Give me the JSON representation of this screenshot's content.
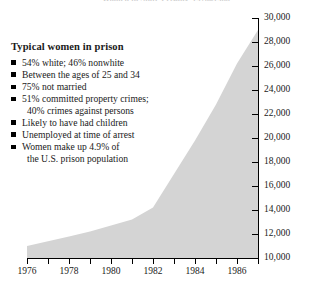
{
  "figure": {
    "title": "Women in State Prisons, 1976–1986",
    "fill_color": "#d4d4d4",
    "axis_color": "#000000"
  },
  "legend": {
    "heading": "Typical women in prison",
    "bullet_glyph": "square-bullet",
    "items": [
      {
        "line1": "54% white; 46% nonwhite",
        "line2": ""
      },
      {
        "line1": "Between the ages of 25 and 34",
        "line2": ""
      },
      {
        "line1": "75% not married",
        "line2": ""
      },
      {
        "line1": "51% committed property crimes;",
        "line2": "40% crimes against persons"
      },
      {
        "line1": "Likely to have had children",
        "line2": ""
      },
      {
        "line1": "Unemployed at time of arrest",
        "line2": ""
      },
      {
        "line1": "Women make up 4.9% of",
        "line2": "the U.S. prison population"
      }
    ]
  },
  "chart_data": {
    "type": "area",
    "title": "Women in State Prisons, 1976–1986",
    "xlabel": "",
    "ylabel": "",
    "xlim": [
      1976,
      1987
    ],
    "ylim": [
      10000,
      30000
    ],
    "grid": false,
    "legend_position": "none",
    "y_ticks": [
      10000,
      12000,
      14000,
      16000,
      18000,
      20000,
      22000,
      24000,
      26000,
      28000,
      30000
    ],
    "y_tick_labels": [
      "10,000",
      "12,000",
      "14,000",
      "16,000",
      "18,000",
      "20,000",
      "22,000",
      "24,000",
      "26,000",
      "28,000",
      "30,000"
    ],
    "x_ticks": [
      1976,
      1977,
      1978,
      1979,
      1980,
      1981,
      1982,
      1983,
      1984,
      1985,
      1986,
      1987
    ],
    "x_tick_labels": [
      "1976",
      "",
      "1978",
      "",
      "1980",
      "",
      "1982",
      "",
      "1984",
      "",
      "1986",
      ""
    ],
    "x": [
      1976,
      1977,
      1978,
      1979,
      1980,
      1981,
      1982,
      1983,
      1984,
      1985,
      1986,
      1987
    ],
    "values": [
      11000,
      11400,
      11800,
      12200,
      12700,
      13200,
      14200,
      17000,
      19800,
      22800,
      26200,
      29000
    ],
    "baseline": 10000
  }
}
